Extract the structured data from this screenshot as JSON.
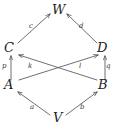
{
  "diagram": {
    "type": "commutative-diagram",
    "stroke_color": "#4a4a4a",
    "text_color": "#232323",
    "background_color": "#ffffff",
    "nodes": [
      {
        "id": "W",
        "label": "W",
        "x": 57,
        "y": 10
      },
      {
        "id": "C",
        "label": "C",
        "x": 9,
        "y": 49
      },
      {
        "id": "D",
        "label": "D",
        "x": 102,
        "y": 49
      },
      {
        "id": "A",
        "label": "A",
        "x": 9,
        "y": 85
      },
      {
        "id": "B",
        "label": "B",
        "x": 102,
        "y": 85
      },
      {
        "id": "V",
        "label": "V",
        "x": 57,
        "y": 118
      }
    ],
    "edges": [
      {
        "id": "c",
        "label": "c",
        "from": "C",
        "to": "W",
        "lx": 31,
        "ly": 26
      },
      {
        "id": "d",
        "label": "d",
        "from": "D",
        "to": "W",
        "lx": 81,
        "ly": 26
      },
      {
        "id": "p",
        "label": "p",
        "from": "A",
        "to": "C",
        "lx": 4,
        "ly": 66
      },
      {
        "id": "q",
        "label": "q",
        "from": "B",
        "to": "D",
        "lx": 107,
        "ly": 66
      },
      {
        "id": "k",
        "label": "k",
        "from": "A",
        "to": "D",
        "lx": 30,
        "ly": 66
      },
      {
        "id": "l",
        "label": "l",
        "from": "B",
        "to": "C",
        "lx": 80,
        "ly": 66
      },
      {
        "id": "a",
        "label": "a",
        "from": "V",
        "to": "A",
        "lx": 31,
        "ly": 107
      },
      {
        "id": "b",
        "label": "b",
        "from": "V",
        "to": "B",
        "lx": 81,
        "ly": 107
      }
    ]
  }
}
